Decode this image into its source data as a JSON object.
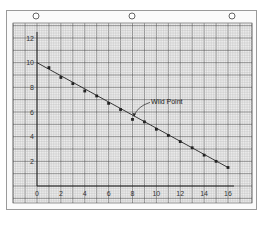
{
  "chart_data": {
    "type": "line",
    "title": "",
    "xlabel": "",
    "ylabel": "",
    "xlim": [
      0,
      16
    ],
    "ylim": [
      0,
      12
    ],
    "x_ticks": [
      "0",
      "2",
      "4",
      "6",
      "8",
      "10",
      "12",
      "14",
      "16"
    ],
    "y_ticks": [
      "2",
      "4",
      "6",
      "8",
      "10",
      "12"
    ],
    "grid": true,
    "series": [
      {
        "name": "measured points",
        "x": [
          1,
          2,
          3,
          4,
          5,
          6,
          7,
          9,
          10,
          11,
          12,
          13,
          14,
          15,
          16
        ],
        "y": [
          9.6,
          8.8,
          8.3,
          7.7,
          7.3,
          6.7,
          6.2,
          5.2,
          4.6,
          4.1,
          3.6,
          3.1,
          2.5,
          2.0,
          1.5
        ]
      },
      {
        "name": "fitted line",
        "x": [
          0,
          16
        ],
        "y": [
          10.0,
          1.5
        ]
      }
    ],
    "wild_point": {
      "x": 8,
      "y": 5.4
    },
    "annotations": [
      {
        "text": "Wild Point",
        "target_x": 8,
        "target_y": 5.4
      }
    ],
    "colors": {
      "grid_major": "#555555",
      "grid_minor": "#bdbdbd",
      "paper": "#ececec",
      "ink": "#222222"
    }
  }
}
